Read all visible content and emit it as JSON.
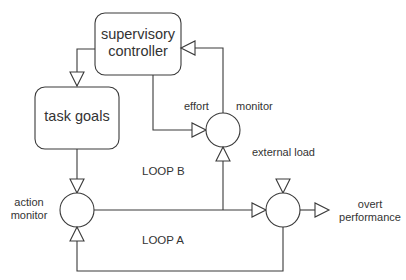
{
  "diagram": {
    "type": "control-loop block diagram",
    "colors": {
      "line": "#3a3a3a",
      "text": "#333333",
      "background": "#ffffff"
    },
    "boxes": {
      "supervisory_controller": {
        "line1": "supervisory",
        "line2": "controller"
      },
      "task_goals": {
        "label": "task goals"
      }
    },
    "nodes": {
      "effort_monitor": {
        "label_left": "effort",
        "label_right": "monitor"
      },
      "action_monitor": {
        "line1": "action",
        "line2": "monitor"
      },
      "performance_junction": {
        "input_label": "external load",
        "output_line1": "overt",
        "output_line2": "performance"
      }
    },
    "loops": {
      "loop_b": "LOOP B",
      "loop_a": "LOOP A"
    }
  }
}
